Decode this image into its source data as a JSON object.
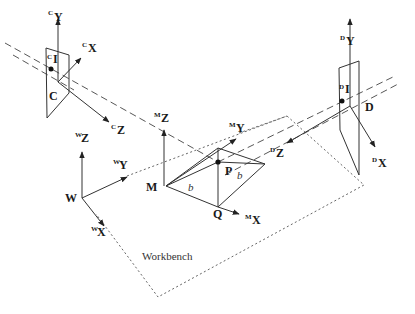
{
  "diagram": {
    "camera_c": {
      "origin_label": "C",
      "image_point_label": "I",
      "image_point_sup": "C",
      "axes": [
        {
          "sup": "C",
          "name": "Y"
        },
        {
          "sup": "C",
          "name": "X"
        },
        {
          "sup": "C",
          "name": "Z"
        }
      ]
    },
    "camera_d": {
      "origin_label": "D",
      "image_point_label": "I",
      "image_point_sup": "D",
      "axes": [
        {
          "sup": "D",
          "name": "Y"
        },
        {
          "sup": "D",
          "name": "X"
        },
        {
          "sup": "D",
          "name": "Z"
        }
      ]
    },
    "world": {
      "origin_label": "W",
      "axes": [
        {
          "sup": "W",
          "name": "Z"
        },
        {
          "sup": "W",
          "name": "Y"
        },
        {
          "sup": "W",
          "name": "X"
        }
      ]
    },
    "marker": {
      "origin_label": "M",
      "point_p": "P",
      "point_q": "Q",
      "edge_label_1": "b",
      "edge_label_2": "b",
      "axes": [
        {
          "sup": "M",
          "name": "Z"
        },
        {
          "sup": "M",
          "name": "Y"
        },
        {
          "sup": "M",
          "name": "X"
        }
      ]
    },
    "workbench_label": "Workbench",
    "colors": {
      "line": "#333333",
      "background": "#ffffff"
    }
  }
}
